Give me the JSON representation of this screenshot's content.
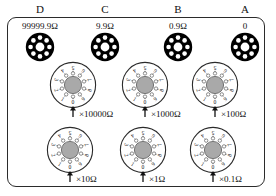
{
  "figure": {
    "frame_color": "#2b2b2b",
    "dial_face_color": "#ffffff",
    "dial_hub_color": "#a9a9a9",
    "terminal_color": "#000000"
  },
  "terminals": [
    {
      "id": "D",
      "letter": "D",
      "value": "99999.9Ω"
    },
    {
      "id": "C",
      "letter": "C",
      "value": "9.9Ω"
    },
    {
      "id": "B",
      "letter": "B",
      "value": "0.9Ω"
    },
    {
      "id": "A",
      "letter": "A",
      "value": "0"
    }
  ],
  "dial_digits": [
    "0",
    "1",
    "2",
    "3",
    "4",
    "5",
    "6",
    "7",
    "8",
    "9"
  ],
  "dials": [
    {
      "id": "x10000",
      "multiplier": "×10000Ω",
      "setting": "0",
      "row": "top",
      "col": 1
    },
    {
      "id": "x1000",
      "multiplier": "×1000Ω",
      "setting": "0",
      "row": "top",
      "col": 2
    },
    {
      "id": "x100",
      "multiplier": "×100Ω",
      "setting": "0",
      "row": "top",
      "col": 3
    },
    {
      "id": "x10",
      "multiplier": "×10Ω",
      "setting": "0",
      "row": "bottom",
      "col": 1
    },
    {
      "id": "x1",
      "multiplier": "×1Ω",
      "setting": "0",
      "row": "bottom",
      "col": 2
    },
    {
      "id": "x0.1",
      "multiplier": "×0.1Ω",
      "setting": "0",
      "row": "bottom",
      "col": 3
    }
  ]
}
